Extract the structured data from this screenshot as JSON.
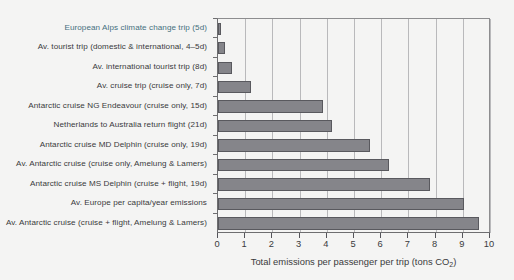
{
  "chart_data": {
    "type": "bar",
    "orientation": "horizontal",
    "title": "",
    "xlabel": "Total emissions per passenger per trip (tons CO2)",
    "xlabel_main": "Total emissions per passenger per trip (tons CO",
    "xlabel_sub": "2",
    "xlabel_tail": ")",
    "ylabel": "",
    "xlim": [
      0,
      10
    ],
    "xticks": [
      0,
      1,
      2,
      3,
      4,
      5,
      6,
      7,
      8,
      9,
      10
    ],
    "xtick_labels": [
      "0",
      "1",
      "2",
      "3",
      "4",
      "5",
      "6",
      "7",
      "8",
      "9",
      "10"
    ],
    "grid": true,
    "legend": "none",
    "bar_color": "#85858a",
    "bar_edge_color": "#59595e",
    "highlight_label_color": "#46707e",
    "categories": [
      "European Alps climate change trip (5d)",
      "Av. tourist trip (domestic & international, 4–5d)",
      "Av. international tourist trip (8d)",
      "Av. cruise trip (cruise only, 7d)",
      "Antarctic cruise NG Endeavour (cruise only, 15d)",
      "Netherlands to Australia return flight (21d)",
      "Antarctic cruise MD Delphin (cruise only, 19d)",
      "Av. Antarctic cruise (cruise only, Amelung & Lamers)",
      "Antarctic cruise MS Delphin (cruise + flight, 19d)",
      "Av. Europe per capita/year emissions",
      "Av. Antarctic cruise (cruise + flight, Amelung & Lamers)"
    ],
    "values": [
      0.1,
      0.25,
      0.5,
      1.2,
      3.85,
      4.2,
      5.6,
      6.3,
      7.8,
      9.05,
      9.6
    ],
    "highlighted_categories": [
      0
    ]
  }
}
